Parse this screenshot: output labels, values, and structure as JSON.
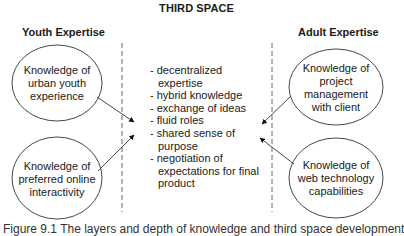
{
  "title": "THIRD SPACE",
  "headings": {
    "left": "Youth Expertise",
    "right": "Adult Expertise"
  },
  "nodes": {
    "youth_top": "Knowledge of urban youth experience",
    "youth_bottom": "Knowledge of preferred online interactivity",
    "adult_top": "Knowledge of project management with client",
    "adult_bottom": "Knowledge of web technology capabilities"
  },
  "node_lines": {
    "youth_top": [
      "Knowledge of",
      "urban youth",
      "experience"
    ],
    "youth_bottom": [
      "Knowledge of",
      "preferred online",
      "interactivity"
    ],
    "adult_top": [
      "Knowledge of",
      "project",
      "management",
      "with client"
    ],
    "adult_bottom": [
      "Knowledge of",
      "web technology",
      "capabilities"
    ]
  },
  "third_space_items": [
    "- decentralized expertise",
    "- hybrid knowledge",
    "- exchange of ideas",
    "- fluid roles",
    "- shared sense of purpose",
    "- negotiation of expectations for final product"
  ],
  "caption": "Figure 9.1 The layers and depth of knowledge and third space development",
  "colors": {
    "stroke": "#333333",
    "dash": "#666666",
    "text": "#1a1a1a"
  }
}
